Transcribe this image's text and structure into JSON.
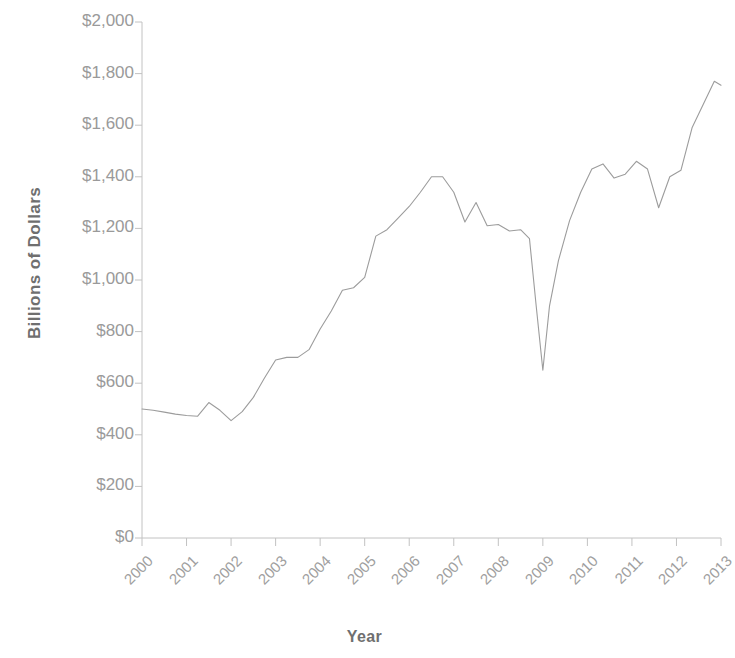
{
  "chart_data": {
    "type": "line",
    "title": "",
    "subtitle": "",
    "xlabel": "Year",
    "ylabel": "Billions of Dollars",
    "xlim": [
      2000,
      2013
    ],
    "ylim": [
      0,
      2000
    ],
    "grid": false,
    "legend": false,
    "legend_position": "none",
    "line_color": "#9c9c9c",
    "text_color": "#9a9a9a",
    "axis_title_color": "#6f6f6f",
    "y_ticks": [
      0,
      200,
      400,
      600,
      800,
      1000,
      1200,
      1400,
      1600,
      1800,
      2000
    ],
    "y_tick_labels": [
      "$0",
      "$200",
      "$400",
      "$600",
      "$800",
      "$1,000",
      "$1,200",
      "$1,400",
      "$1,600",
      "$1,800",
      "$2,000"
    ],
    "x_ticks": [
      2000,
      2001,
      2002,
      2003,
      2004,
      2005,
      2006,
      2007,
      2008,
      2009,
      2010,
      2011,
      2012,
      2013
    ],
    "x_tick_labels": [
      "2000",
      "2001",
      "2002",
      "2003",
      "2004",
      "2005",
      "2006",
      "2007",
      "2008",
      "2009",
      "2010",
      "2011",
      "2012",
      "2013"
    ],
    "series": [
      {
        "name": "Value",
        "x": [
          2000.0,
          2000.25,
          2000.5,
          2000.75,
          2001.0,
          2001.25,
          2001.5,
          2001.75,
          2002.0,
          2002.25,
          2002.5,
          2002.75,
          2003.0,
          2003.25,
          2003.5,
          2003.75,
          2004.0,
          2004.25,
          2004.5,
          2004.75,
          2005.0,
          2005.25,
          2005.5,
          2005.75,
          2006.0,
          2006.25,
          2006.5,
          2006.75,
          2007.0,
          2007.25,
          2007.5,
          2007.75,
          2008.0,
          2008.25,
          2008.5,
          2008.7,
          2008.85,
          2009.0,
          2009.15,
          2009.35,
          2009.6,
          2009.85,
          2010.1,
          2010.35,
          2010.6,
          2010.85,
          2011.1,
          2011.35,
          2011.6,
          2011.85,
          2012.1,
          2012.35,
          2012.6,
          2012.85,
          2013.0
        ],
        "y": [
          500,
          495,
          488,
          480,
          475,
          472,
          525,
          495,
          455,
          490,
          545,
          620,
          690,
          700,
          700,
          730,
          810,
          880,
          960,
          970,
          1010,
          1170,
          1195,
          1240,
          1285,
          1340,
          1400,
          1400,
          1340,
          1225,
          1300,
          1210,
          1215,
          1190,
          1195,
          1160,
          900,
          650,
          900,
          1075,
          1230,
          1340,
          1430,
          1450,
          1395,
          1410,
          1460,
          1430,
          1280,
          1400,
          1425,
          1590,
          1680,
          1770,
          1755
        ]
      }
    ]
  },
  "axes": {
    "y_title": "Billions of Dollars",
    "x_title": "Year"
  }
}
